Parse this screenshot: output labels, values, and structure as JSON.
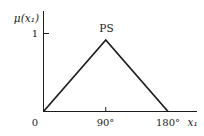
{
  "figure": {
    "background": "#ffffff",
    "ink_color": "#1c1c1c"
  },
  "chart_data": {
    "type": "line",
    "title": "",
    "annotation": {
      "text": "PS",
      "at_x": 90,
      "at_y": 1
    },
    "ylabel": "μ(x₁)",
    "xlabel": "x₁",
    "x_ticks": [
      {
        "value": 0,
        "label": "0"
      },
      {
        "value": 90,
        "label": "90°"
      },
      {
        "value": 180,
        "label": "180°"
      }
    ],
    "y_ticks": [
      {
        "value": 1,
        "label": "1"
      }
    ],
    "xlim": [
      0,
      185
    ],
    "ylim": [
      0,
      1.4
    ],
    "grid": false,
    "legend": "none",
    "series": [
      {
        "name": "PS membership function",
        "x": [
          0,
          90,
          180
        ],
        "y": [
          0,
          1,
          0
        ]
      }
    ]
  }
}
